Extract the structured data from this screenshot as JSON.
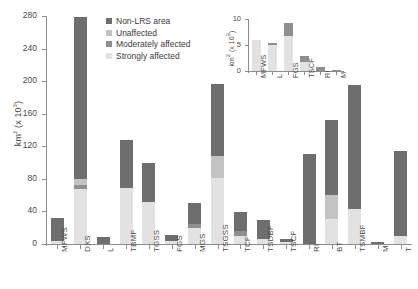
{
  "chart_data": [
    {
      "id": "main",
      "type": "bar",
      "stacked": true,
      "title": "",
      "xlabel": "",
      "ylabel": "km² (x 10³)",
      "ylim": [
        0,
        280
      ],
      "yticks": [
        0,
        40,
        80,
        120,
        160,
        200,
        240,
        280
      ],
      "grid": false,
      "legend": {
        "position": "top-left-inside",
        "entries": [
          {
            "label": "Non-LRS area",
            "color": "#6e6e6e"
          },
          {
            "label": "Unaffected",
            "color": "#c3c3c3"
          },
          {
            "label": "Moderately affected",
            "color": "#8f8f8f"
          },
          {
            "label": "Strongly affected",
            "color": "#e2e2e2"
          }
        ]
      },
      "categories": [
        "MFWS",
        "DXS",
        "L",
        "TBMF",
        "TGSS",
        "FGS",
        "MGS",
        "TSGSS",
        "TCF",
        "TSDBF",
        "TSCF",
        "RI",
        "BT",
        "TSMBF",
        "M",
        "T"
      ],
      "series": [
        {
          "name": "Strongly affected",
          "color": "#e2e2e2",
          "values": [
            4,
            67,
            0,
            69,
            52,
            4,
            20,
            81,
            10,
            6,
            3,
            0,
            31,
            43,
            0,
            10
          ]
        },
        {
          "name": "Moderately affected",
          "color": "#8f8f8f",
          "values": [
            0,
            6,
            0,
            0,
            0,
            0,
            5,
            0,
            6,
            0,
            0,
            0,
            0,
            0,
            0,
            0
          ]
        },
        {
          "name": "Unaffected",
          "color": "#c3c3c3",
          "values": [
            0,
            7,
            0,
            0,
            0,
            0,
            0,
            27,
            0,
            0,
            0,
            0,
            29,
            0,
            0,
            0
          ]
        },
        {
          "name": "Non-LRS area",
          "color": "#6e6e6e",
          "values": [
            28,
            199,
            9,
            59,
            48,
            7,
            25,
            88,
            23,
            23,
            3,
            110,
            92,
            152,
            3,
            104
          ]
        }
      ],
      "totals": [
        32,
        279,
        9,
        128,
        100,
        11,
        50,
        196,
        39,
        29,
        6,
        110,
        152,
        195,
        3,
        114
      ]
    },
    {
      "id": "inset",
      "type": "bar",
      "stacked": true,
      "title": "",
      "xlabel": "",
      "ylabel": "km² (x 10³)",
      "ylim": [
        0,
        10
      ],
      "yticks": [
        0,
        5,
        10
      ],
      "grid": false,
      "categories": [
        "MFWS",
        "L",
        "FGS",
        "TSCF",
        "RI",
        "M"
      ],
      "series": [
        {
          "name": "Strongly affected",
          "color": "#e2e2e2",
          "values": [
            5.9,
            5.0,
            6.8,
            1.8,
            0.0,
            0.0
          ]
        },
        {
          "name": "Moderately affected",
          "color": "#8f8f8f",
          "values": [
            0.1,
            0.35,
            2.4,
            1.0,
            0.7,
            0.15
          ]
        }
      ],
      "totals": [
        6.0,
        5.35,
        9.2,
        2.8,
        0.7,
        0.15
      ]
    }
  ]
}
